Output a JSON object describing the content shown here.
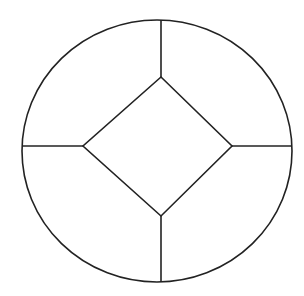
{
  "diagram": {
    "type": "circle-with-inscribed-diamond",
    "colors": {
      "background": "#ffffff",
      "stroke": "#222222"
    },
    "stroke_width": 1.6,
    "ellipse": {
      "cx": 157,
      "cy": 151,
      "rx": 135,
      "ry": 131
    },
    "diamond": {
      "top": [
        161,
        77
      ],
      "right": [
        232,
        146
      ],
      "bottom": [
        161,
        216
      ],
      "left": [
        83,
        146
      ]
    },
    "spokes": [
      {
        "name": "top",
        "x1": 161,
        "y1": 20,
        "x2": 161,
        "y2": 77
      },
      {
        "name": "right",
        "x1": 232,
        "y1": 146,
        "x2": 292,
        "y2": 146
      },
      {
        "name": "bottom",
        "x1": 161,
        "y1": 216,
        "x2": 161,
        "y2": 282
      },
      {
        "name": "left",
        "x1": 22,
        "y1": 146,
        "x2": 83,
        "y2": 146
      }
    ]
  }
}
